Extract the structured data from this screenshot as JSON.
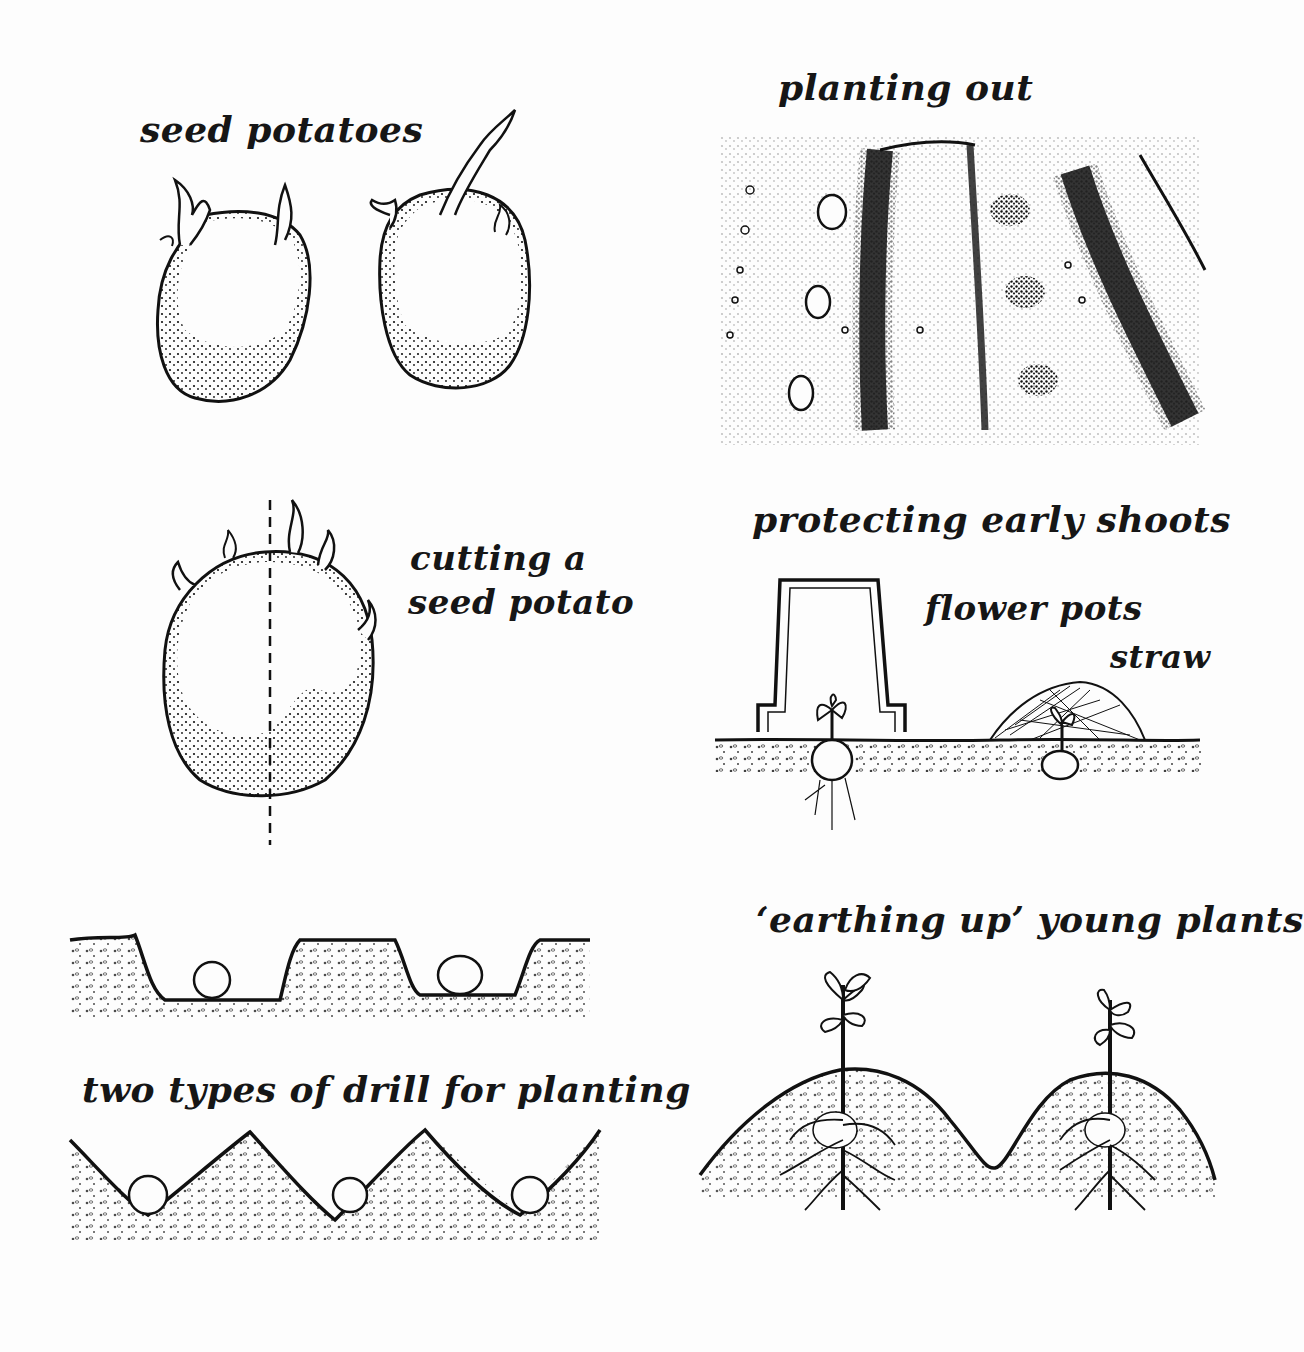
{
  "illustration": {
    "subject": "growing potatoes",
    "background_color": "#fdfdfd",
    "ink_color": "#111111",
    "panels": [
      {
        "id": "seed-potatoes",
        "label": "seed potatoes"
      },
      {
        "id": "planting-out",
        "label": "planting out"
      },
      {
        "id": "cutting",
        "label_line1": "cutting a",
        "label_line2": "seed potato"
      },
      {
        "id": "protecting",
        "label": "protecting early shoots",
        "sublabels": {
          "pots": "flower pots",
          "straw": "straw"
        }
      },
      {
        "id": "drills",
        "label": "two types of drill for planting"
      },
      {
        "id": "earthing-up",
        "label": "‘earthing up’ young plants"
      }
    ]
  }
}
